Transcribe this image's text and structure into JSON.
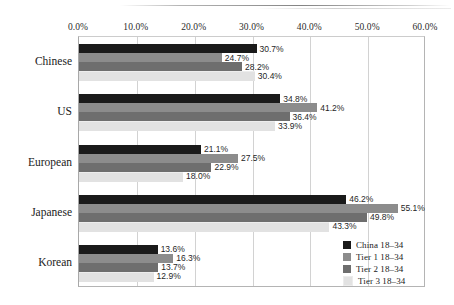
{
  "chart_data": {
    "type": "bar",
    "orientation": "horizontal",
    "title": "",
    "xlabel": "",
    "ylabel": "",
    "xlim": [
      0,
      60
    ],
    "xticks": [
      "0.0%",
      "10.0%",
      "20.0%",
      "30.0%",
      "40.0%",
      "50.0%",
      "60.0%"
    ],
    "xtick_values": [
      0,
      10,
      20,
      30,
      40,
      50,
      60
    ],
    "grid": true,
    "legend_position": "bottom-right",
    "categories": [
      "Chinese",
      "US",
      "European",
      "Japanese",
      "Korean"
    ],
    "series": [
      {
        "name": "China 18–34",
        "color": "#1a1a1a",
        "values": [
          30.7,
          34.8,
          21.1,
          46.2,
          13.6
        ],
        "labels": [
          "30.7%",
          "34.8%",
          "21.1%",
          "46.2%",
          "13.6%"
        ]
      },
      {
        "name": "Tier 1 18–34",
        "color": "#8c8c8c",
        "values": [
          24.7,
          41.2,
          27.5,
          55.1,
          16.3
        ],
        "labels": [
          "24.7%",
          "41.2%",
          "27.5%",
          "55.1%",
          "16.3%"
        ]
      },
      {
        "name": "Tier 2 18–34",
        "color": "#6e6e6e",
        "values": [
          28.2,
          36.4,
          22.9,
          49.8,
          13.7
        ],
        "labels": [
          "28.2%",
          "36.4%",
          "22.9%",
          "49.8%",
          "13.7%"
        ]
      },
      {
        "name": "Tier 3 18–34",
        "color": "#e2e2e2",
        "values": [
          30.4,
          33.9,
          18.0,
          43.3,
          12.9
        ],
        "labels": [
          "30.4%",
          "33.9%",
          "18.0%",
          "43.3%",
          "12.9%"
        ]
      }
    ]
  }
}
